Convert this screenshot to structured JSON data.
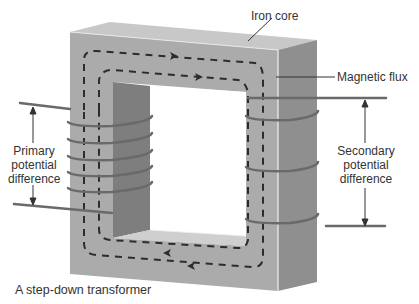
{
  "title": "A step-down transformer",
  "labels": {
    "iron_core": "Iron core",
    "magnetic_flux": "Magnetic flux",
    "primary": [
      "Primary",
      "potential",
      "difference"
    ],
    "secondary": [
      "Secondary",
      "potential",
      "difference"
    ]
  },
  "caption": "A step-down transformer",
  "components": {
    "primary_coil_turns": 5,
    "secondary_coil_turns": 3,
    "flux_direction": "clockwise"
  },
  "colors": {
    "core_front": "#a9a9a9",
    "core_top": "#c4c4c4",
    "core_side": "#8e8e8e",
    "inner_shadow": "#7d7d7d",
    "wire": "#6a6a6a",
    "flux": "#2c2c2c",
    "text": "#333333"
  }
}
